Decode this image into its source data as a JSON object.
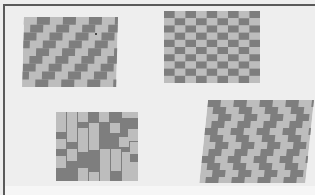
{
  "image": {
    "description": "Photograph of four tiled floor/paving pattern samples arranged in a 2x2 grid, shown in grayscale perspective",
    "colors": {
      "background": "#eeeeee",
      "frame": "#5a5a5a",
      "dark_tile": "#7e7e7e",
      "light_tile": "#bdbdbd"
    },
    "panels": [
      {
        "id": "top-left",
        "pattern": "diagonal stepped stripes"
      },
      {
        "id": "top-right",
        "pattern": "checkerboard"
      },
      {
        "id": "bottom-left",
        "pattern": "random rectangular blocks"
      },
      {
        "id": "bottom-right",
        "pattern": "herringbone zigzag"
      }
    ]
  }
}
